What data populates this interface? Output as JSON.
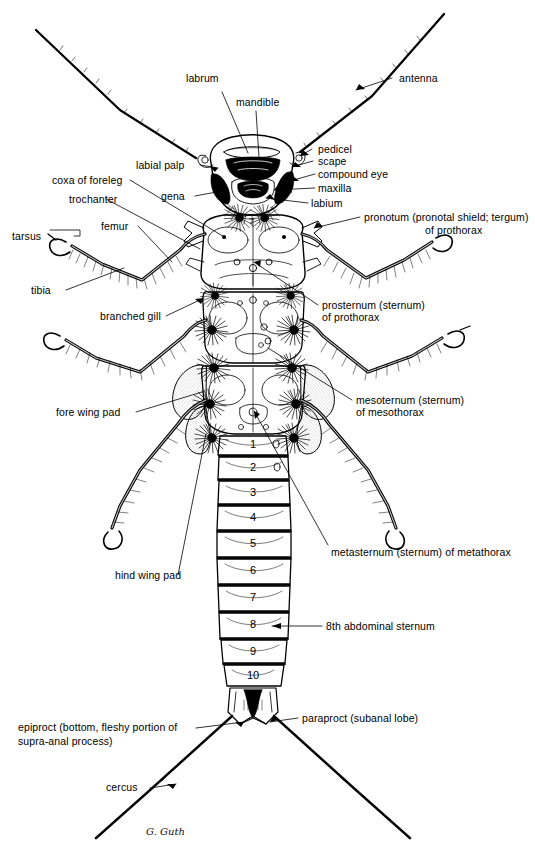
{
  "figure": {
    "signature": "G. Guth",
    "ink_color": "#000000",
    "background_color": "#ffffff"
  },
  "labels": {
    "labrum": "labrum",
    "mandible": "mandible",
    "antenna": "antenna",
    "pedicel": "pedicel",
    "scape": "scape",
    "compound_eye": "compound eye",
    "maxilla": "maxilla",
    "labium": "labium",
    "labial_palp": "labial palp",
    "gena": "gena",
    "coxa_of_foreleg": "coxa of foreleg",
    "trochanter": "trochanter",
    "femur": "femur",
    "tarsus": "tarsus",
    "tibia": "tibia",
    "pronotum_line1": "pronotum (pronotal shield; tergum)",
    "pronotum_line2": "of prothorax",
    "prosternum_line1": "prosternum (sternum)",
    "prosternum_line2": "of prothorax",
    "branched_gill": "branched gill",
    "mesosternum_line1": "mesoternum (sternum)",
    "mesosternum_line2": "of mesothorax",
    "metasternum": "metasternum (sternum) of metathorax",
    "fore_wing_pad": "fore wing pad",
    "hind_wing_pad": "hind wing pad",
    "eighth_abdominal_sternum": "8th abdominal sternum",
    "paraproct": "paraproct (subanal lobe)",
    "epiproct_line1": "epiproct (bottom, fleshy portion of",
    "epiproct_line2": "supra-anal process)",
    "cercus": "cercus"
  },
  "abdominal_segments": [
    "1",
    "2",
    "3",
    "4",
    "5",
    "6",
    "7",
    "8",
    "9",
    "10"
  ]
}
